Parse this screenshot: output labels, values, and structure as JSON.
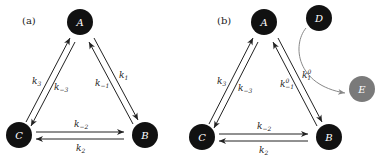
{
  "panels": [
    {
      "label": "(a)",
      "nodes": {
        "A": "A",
        "B": "B",
        "C": "C"
      },
      "rates": {
        "k3": {
          "base": "k",
          "sub": "3",
          "sup": ""
        },
        "km3": {
          "base": "k",
          "sub": "−3",
          "sup": ""
        },
        "k1": {
          "base": "k",
          "sub": "1",
          "sup": ""
        },
        "km1": {
          "base": "k",
          "sub": "−1",
          "sup": ""
        },
        "km2": {
          "base": "k",
          "sub": "−2",
          "sup": ""
        },
        "k2": {
          "base": "k",
          "sub": "2",
          "sup": ""
        }
      }
    },
    {
      "label": "(b)",
      "nodes": {
        "A": "A",
        "B": "B",
        "C": "C",
        "D": "D",
        "E": "E"
      },
      "rates": {
        "k3": {
          "base": "k",
          "sub": "3",
          "sup": ""
        },
        "km3": {
          "base": "k",
          "sub": "−3",
          "sup": ""
        },
        "k1": {
          "base": "k",
          "sub": "1",
          "sup": "0"
        },
        "km1": {
          "base": "k",
          "sub": "−1",
          "sup": "0"
        },
        "km2": {
          "base": "k",
          "sub": "−2",
          "sup": ""
        },
        "k2": {
          "base": "k",
          "sub": "2",
          "sup": ""
        }
      }
    }
  ],
  "colors": {
    "node": "#111111",
    "node_gray": "#7a7a7a",
    "edge": "#222222",
    "curve": "#888888"
  }
}
